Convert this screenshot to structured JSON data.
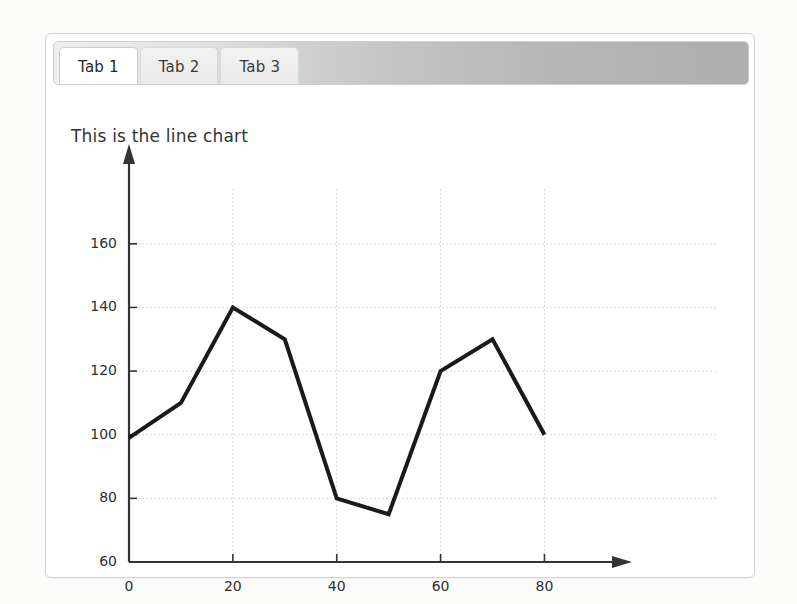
{
  "window": {
    "background_color": "#fbfbfa",
    "panel_background": "#ffffff"
  },
  "tabs": {
    "items": [
      {
        "label": "Tab 1",
        "active": true
      },
      {
        "label": "Tab 2",
        "active": false
      },
      {
        "label": "Tab 3",
        "active": false
      }
    ]
  },
  "chart_data": {
    "type": "line",
    "title": "This is the line chart",
    "xlabel": "",
    "ylabel": "",
    "x": [
      0,
      10,
      20,
      30,
      40,
      50,
      60,
      70,
      80
    ],
    "values": [
      99,
      110,
      140,
      130,
      80,
      75,
      120,
      130,
      100
    ],
    "series": [
      {
        "name": "",
        "values": [
          99,
          110,
          140,
          130,
          80,
          75,
          120,
          130,
          100
        ]
      }
    ],
    "xlim": [
      0,
      88
    ],
    "ylim": [
      60,
      170
    ],
    "xticks": [
      0,
      20,
      40,
      60,
      80
    ],
    "yticks": [
      60,
      80,
      100,
      120,
      140,
      160
    ],
    "xtick_labels": [
      "0",
      "20",
      "40",
      "60",
      "80"
    ],
    "ytick_labels": [
      "60",
      "80",
      "100",
      "120",
      "140",
      "160"
    ],
    "grid": true,
    "grid_color": "#d9d9d9",
    "line_color": "#1a1a1a",
    "line_width": 4,
    "axis_color": "#333333",
    "axis_arrows": true,
    "legend": null,
    "legend_position": "none"
  }
}
